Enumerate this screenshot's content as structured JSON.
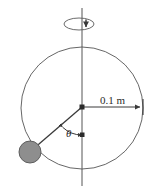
{
  "figure": {
    "type": "physics-diagram",
    "width": 149,
    "height": 190,
    "background_color": "#ffffff"
  },
  "labels": {
    "radius_label": "0.1 m",
    "angle_label": "θ"
  },
  "colors": {
    "line": "#3a3a3a",
    "circle_stroke": "#4a4a4a",
    "ball_fill": "#8e8e8e",
    "ball_stroke": "#5e5e5e",
    "text": "#2b2b2b",
    "axis": "#4a4a4a"
  },
  "geometry": {
    "rotation_axis": {
      "x": 82,
      "y_top": 8,
      "y_bottom": 186
    },
    "spin_indicator": {
      "center_x": 79,
      "center_y": 24,
      "rx": 15,
      "ry": 6,
      "direction": "clockwise-from-above"
    },
    "main_circle": {
      "center_x": 82,
      "center_y": 108,
      "radius": 61
    },
    "pivot": {
      "x": 82,
      "y": 107
    },
    "ball": {
      "x": 30,
      "y": 152,
      "radius": 11
    },
    "radius_arrow": {
      "from_x": 82,
      "from_y": 107,
      "to_x": 143,
      "to_y": 107,
      "value": "0.1 m"
    },
    "angle_arc": {
      "center_x": 82,
      "center_y": 107,
      "radius": 28,
      "label_x": 70,
      "label_y": 136
    }
  },
  "elements": {
    "axis_name": "rotation-axis",
    "spin_name": "rotation-direction-indicator",
    "circle_name": "circular-path",
    "string_name": "pendulum-string",
    "ball_name": "pendulum-bob",
    "radius_name": "radius-dimension",
    "angle_name": "angle-theta"
  }
}
